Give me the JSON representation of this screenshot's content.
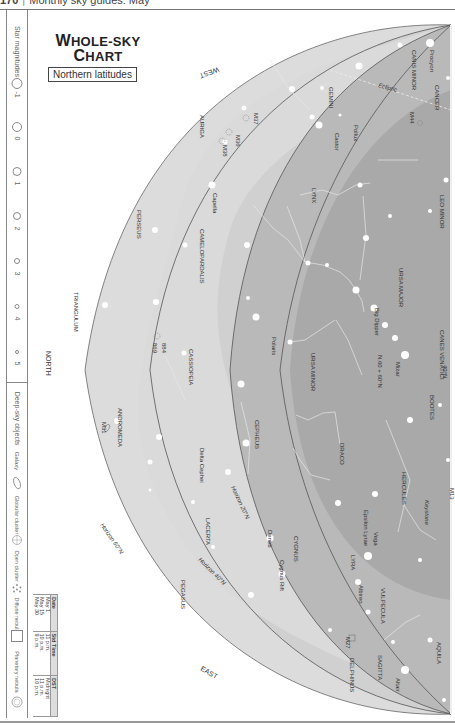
{
  "running_head": {
    "page_number": "170",
    "section": "Monthly sky guides: May"
  },
  "title": {
    "line1_w": "W",
    "line1_rest": "HOLE-SKY",
    "line2_c": "C",
    "line2_rest": "HART",
    "subtitle": "Northern latitudes"
  },
  "sidebar": {
    "star_magnitudes_title": "Star magnitudes",
    "magnitudes": [
      {
        "label": "-1",
        "size": 9
      },
      {
        "label": "0",
        "size": 7.5
      },
      {
        "label": "1",
        "size": 6.5
      },
      {
        "label": "2",
        "size": 5.5
      },
      {
        "label": "3",
        "size": 4
      },
      {
        "label": "4",
        "size": 3
      },
      {
        "label": "5",
        "size": 2
      }
    ],
    "deep_sky_title": "Deep-sky objects",
    "deep_sky": [
      {
        "label": "Galaxy",
        "icon": "galaxy-ellipse-icon"
      },
      {
        "label": "Globular cluster",
        "icon": "globular-cluster-icon"
      },
      {
        "label": "Open cluster",
        "icon": "open-cluster-icon"
      },
      {
        "label": "Diffuse nebula",
        "icon": "diffuse-nebula-square-icon"
      },
      {
        "label": "Planetary nebula",
        "icon": "planetary-nebula-icon"
      }
    ]
  },
  "timetable": {
    "headers": [
      "Date",
      "Std Time",
      "DST"
    ],
    "rows": [
      [
        "May 1",
        "11 p.m.",
        "Midnight"
      ],
      [
        "May 15",
        "10 p.m.",
        "11 p.m."
      ],
      [
        "May 30",
        "9 p.m.",
        "10 p.m."
      ]
    ]
  },
  "chart": {
    "colors": {
      "outer": "#dcdcdc",
      "band": "#cfcfcf",
      "inner": "#b4b4b4",
      "deep": "#a2a2a2",
      "milkyway": "#d6d6d6",
      "line": "#555555",
      "star": "#ffffff",
      "label": "#333333"
    },
    "directions": {
      "west": "WEST",
      "north": "NORTH",
      "east": "EAST"
    },
    "horizons": {
      "h20": "Horizon 20°N",
      "h40": "Horizon 40°N",
      "h60": "Horizon 60°N"
    },
    "ecliptic": "Ecliptic",
    "zenith_40": "40°N",
    "zenith_60": "N.60 + 60°N",
    "constellations": [
      "CANIS MINOR",
      "CANCER",
      "GEMINI",
      "AURIGA",
      "LYNX",
      "LEO MINOR",
      "URSA MAJOR",
      "CANES VENATICI",
      "PERSEUS",
      "CAMELOPARDALIS",
      "TRIANGULUM",
      "CASSIOPEIA",
      "URSA MINOR",
      "BOOTES",
      "CEPHEUS",
      "DRACO",
      "HERCULES",
      "ANDROMEDA",
      "LACERTA",
      "CYGNUS",
      "LYRA",
      "VULPECULA",
      "SAGITTA",
      "DELPHINUS",
      "AQUILA",
      "PEGASUS"
    ],
    "stars_named": [
      "Procyon",
      "Pollux",
      "Castor",
      "Capella",
      "Polaris",
      "Mizar",
      "Vega",
      "Deneb",
      "Albireo",
      "Altair",
      "Big Dipper",
      "Epsilon Lyrae",
      "Keystone",
      "Delta Cephei",
      "Cygnus Rift"
    ],
    "deep_sky_objects": [
      "M44",
      "M37",
      "M36",
      "M38",
      "884",
      "869",
      "M31",
      "M13",
      "M27"
    ]
  }
}
